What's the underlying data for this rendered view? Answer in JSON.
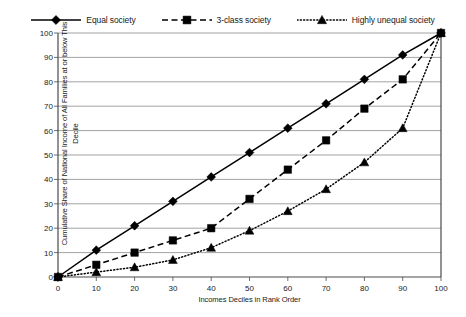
{
  "chart_data": {
    "type": "line",
    "title": "",
    "xlabel": "Incomes Deciles in Rank Order",
    "ylabel": "Cumulative Share of National Income of All Families at or below This Decile",
    "x": [
      0,
      10,
      20,
      30,
      40,
      50,
      60,
      70,
      80,
      90,
      100
    ],
    "xlim": [
      0,
      100
    ],
    "ylim": [
      0,
      100
    ],
    "xticks": [
      "0",
      "10",
      "20",
      "30",
      "40",
      "50",
      "60",
      "70",
      "80",
      "90",
      "100"
    ],
    "yticks": [
      "0",
      "10",
      "20",
      "30",
      "40",
      "50",
      "60",
      "70",
      "80",
      "90",
      "100"
    ],
    "grid": "horizontal",
    "legend_position": "top-center",
    "series": [
      {
        "name": "Equal society",
        "marker": "diamond",
        "line_style": "solid",
        "color": "#000000",
        "values": [
          0,
          11,
          21,
          31,
          41,
          51,
          61,
          71,
          81,
          91,
          100
        ]
      },
      {
        "name": "3-class society",
        "marker": "square",
        "line_style": "dashed",
        "color": "#000000",
        "values": [
          0,
          5,
          10,
          15,
          20,
          32,
          44,
          56,
          69,
          81,
          100
        ]
      },
      {
        "name": "Highly unequal society",
        "marker": "triangle",
        "line_style": "dotted",
        "color": "#000000",
        "values": [
          0,
          2,
          4,
          7,
          12,
          19,
          27,
          36,
          47,
          61,
          100
        ]
      }
    ]
  }
}
